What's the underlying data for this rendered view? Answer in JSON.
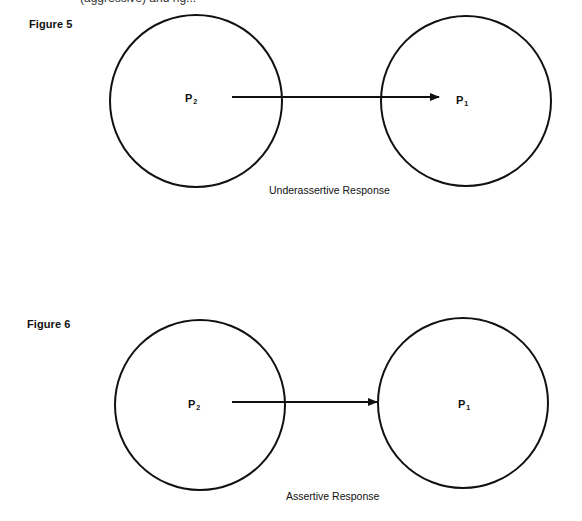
{
  "page": {
    "top_fragment": "(aggressive) and rig..."
  },
  "figures": [
    {
      "label": "Figure 5",
      "caption": "Underassertive Response",
      "left_node": {
        "letter": "P",
        "subscript": "2"
      },
      "right_node": {
        "letter": "P",
        "subscript": "1"
      },
      "arrow": "from P2 across both circle boundaries ending just outside P1 label"
    },
    {
      "label": "Figure 6",
      "caption": "Assertive Response",
      "left_node": {
        "letter": "P",
        "subscript": "2"
      },
      "right_node": {
        "letter": "P",
        "subscript": "1"
      },
      "arrow": "from P2 to the boundary of the P1 circle"
    }
  ],
  "colors": {
    "ink": "#111111",
    "paper": "#ffffff"
  }
}
